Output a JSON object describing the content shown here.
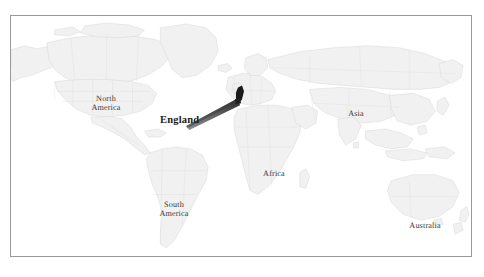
{
  "figure": {
    "type": "world-map",
    "background_color": "#ffffff",
    "frame_color": "#9a9a9a",
    "land_fill": "#f1f1f1",
    "land_stroke": "#d2d2d2",
    "label_color": "#3a3a38",
    "callout_color": "#2b2b2b"
  },
  "map": {
    "region_labels": [
      {
        "id": "north-america",
        "text": "North\nAmerica"
      },
      {
        "id": "south-america",
        "text": "South\nAmerica"
      },
      {
        "id": "asia",
        "text": "Asia"
      },
      {
        "id": "africa",
        "text": "Africa"
      },
      {
        "id": "australia",
        "text": "Australia"
      }
    ]
  },
  "callout": {
    "label": "England",
    "marker_shape": "filled-blob",
    "pointer_shape": "tapered-wedge"
  }
}
